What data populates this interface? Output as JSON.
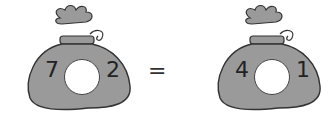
{
  "left_bag": {
    "left_number": "7",
    "right_number": "2",
    "blank": ""
  },
  "equals": "=",
  "right_bag": {
    "left_number": "4",
    "right_number": "1",
    "blank": ""
  },
  "colors": {
    "bag_fill": "#9a9a9a",
    "outline": "#333333",
    "hole": "#ffffff"
  }
}
